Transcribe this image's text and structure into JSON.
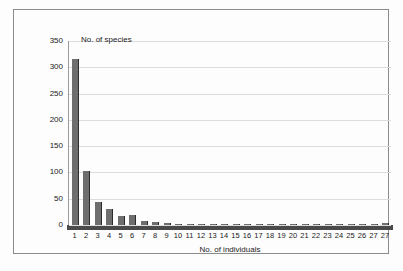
{
  "chart_data": {
    "type": "bar",
    "title": "",
    "ylabel": "No. of species",
    "xlabel": "No. of individuals",
    "ylim": [
      0,
      350
    ],
    "yticks": [
      0,
      50,
      100,
      150,
      200,
      250,
      300,
      350
    ],
    "grid": true,
    "legend": null,
    "categories": [
      "1",
      "2",
      "3",
      "4",
      "5",
      "6",
      "7",
      "8",
      "9",
      "10",
      "11",
      "12",
      "13",
      "14",
      "15",
      "16",
      "17",
      "18",
      "19",
      "20",
      "21",
      "22",
      "23",
      "24",
      "25",
      "26",
      "27",
      "27"
    ],
    "values": [
      315,
      103,
      44,
      30,
      18,
      19,
      7,
      5,
      4,
      1,
      2,
      1,
      2,
      1,
      2,
      2,
      2,
      1,
      2,
      1,
      1,
      1,
      1,
      1,
      1,
      1,
      1,
      3
    ]
  },
  "colors": {
    "bar_fill": "#6e6e6e",
    "bar_edge": "#2b2b2b",
    "gridline": "#dcdcdc",
    "axis": "#4a4a4a",
    "frame": "#8b8b8b",
    "text": "#1a1a1a",
    "background": "#fdfdfd"
  }
}
